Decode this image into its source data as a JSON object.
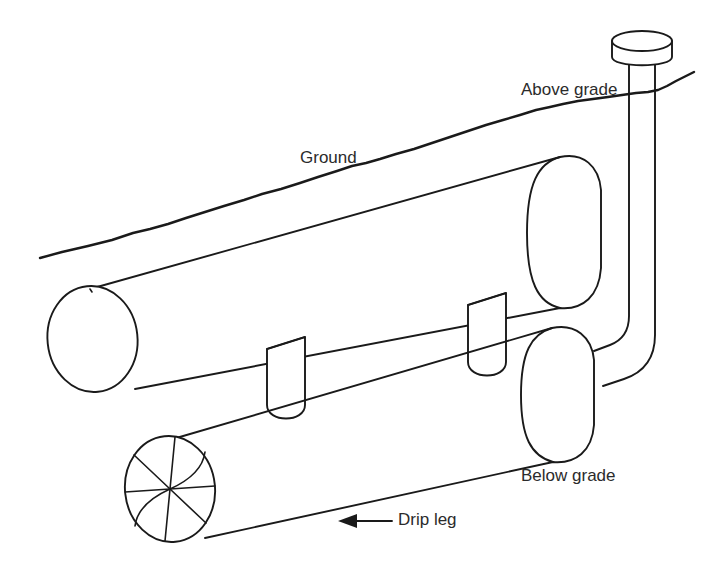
{
  "diagram": {
    "line_color": "#1a1a1a",
    "text_color": "#2b2b2b",
    "background": "#ffffff",
    "labels": {
      "above_grade": "Above grade",
      "ground": "Ground",
      "below_grade": "Below grade",
      "drip_leg": "Drip leg"
    },
    "parts": {
      "riser_cap": "riser-cap",
      "riser_pipe": "riser-pipe",
      "upper_cylinder": "upper-cylinder",
      "lower_cylinder": "lower-cylinder",
      "support_leg_left": "support-leg-left",
      "support_leg_right": "support-leg-right",
      "drip_leg_end_cap": "drip-leg-end-cap",
      "ground_line": "ground-line",
      "drip_leg_arrow": "drip-leg-arrow"
    }
  }
}
